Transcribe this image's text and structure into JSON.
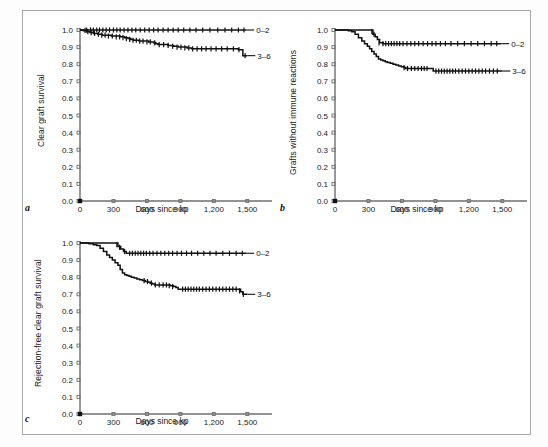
{
  "figure": {
    "background": "#ffffff",
    "frame_color": "#a9a9a9",
    "axis_color": "#6e6e6e",
    "curve_color": "#111111"
  },
  "axes_common": {
    "xlabel": "Days since kp",
    "xticks": [
      "0",
      "300",
      "600",
      "900",
      "1,200",
      "1,500"
    ],
    "xtick_values": [
      0,
      300,
      600,
      900,
      1200,
      1500
    ],
    "yticks": [
      "0.0",
      "0.1",
      "0.2",
      "0.3",
      "0.4",
      "0.5",
      "0.6",
      "0.7",
      "0.8",
      "0.9",
      "1.0"
    ],
    "ytick_values": [
      0.0,
      0.1,
      0.2,
      0.3,
      0.4,
      0.5,
      0.6,
      0.7,
      0.8,
      0.9,
      1.0
    ],
    "xlim": [
      0,
      1560
    ],
    "ylim": [
      0.0,
      1.0
    ],
    "series_labels": [
      "0–2",
      "3–6"
    ]
  },
  "panels": [
    {
      "letter": "a",
      "ylabel": "Clear graft survival"
    },
    {
      "letter": "b",
      "ylabel": "Grafts without immune reactions"
    },
    {
      "letter": "c",
      "ylabel": "Rejection-free clear graft survival"
    }
  ],
  "chart_data": [
    {
      "type": "line",
      "panel": "a",
      "title": "",
      "xlabel": "Days since kp",
      "ylabel": "Clear graft survival",
      "xlim": [
        0,
        1560
      ],
      "ylim": [
        0.0,
        1.0
      ],
      "grid": false,
      "legend_position": "right-of-curve-end",
      "series": [
        {
          "name": "0–2",
          "label": "0–2",
          "step": "post",
          "x": [
            0,
            40,
            90,
            140,
            200,
            260,
            330,
            400,
            470,
            540,
            620,
            700,
            780,
            860,
            950,
            1040,
            1130,
            1220,
            1320,
            1420,
            1490
          ],
          "y": [
            1.0,
            1.0,
            1.0,
            1.0,
            1.0,
            1.0,
            1.0,
            1.0,
            1.0,
            1.0,
            1.0,
            1.0,
            1.0,
            1.0,
            1.0,
            1.0,
            1.0,
            1.0,
            1.0,
            1.0,
            1.0
          ],
          "censor_x": [
            60,
            95,
            120,
            150,
            175,
            205,
            235,
            265,
            300,
            330,
            360,
            395,
            430,
            465,
            500,
            540,
            580,
            620,
            660,
            700,
            745,
            790,
            835,
            880,
            930,
            985,
            1040,
            1100,
            1165,
            1235,
            1300,
            1360,
            1420,
            1470
          ],
          "censor_y": [
            1.0,
            1.0,
            1.0,
            1.0,
            1.0,
            1.0,
            1.0,
            1.0,
            1.0,
            1.0,
            1.0,
            1.0,
            1.0,
            1.0,
            1.0,
            1.0,
            1.0,
            1.0,
            1.0,
            1.0,
            1.0,
            1.0,
            1.0,
            1.0,
            1.0,
            1.0,
            1.0,
            1.0,
            1.0,
            1.0,
            1.0,
            1.0,
            1.0,
            1.0
          ]
        },
        {
          "name": "3–6",
          "label": "3–6",
          "step": "post",
          "x": [
            0,
            30,
            60,
            90,
            120,
            160,
            200,
            240,
            280,
            320,
            360,
            400,
            430,
            455,
            480,
            505,
            530,
            560,
            590,
            615,
            640,
            660,
            680,
            700,
            740,
            790,
            840,
            880,
            920,
            960,
            1000,
            1050,
            1100,
            1180,
            1260,
            1340,
            1420,
            1460,
            1470,
            1500
          ],
          "y": [
            1.0,
            0.995,
            0.99,
            0.985,
            0.98,
            0.975,
            0.97,
            0.97,
            0.965,
            0.965,
            0.96,
            0.955,
            0.95,
            0.945,
            0.94,
            0.94,
            0.935,
            0.935,
            0.935,
            0.93,
            0.93,
            0.925,
            0.92,
            0.915,
            0.915,
            0.91,
            0.905,
            0.9,
            0.9,
            0.895,
            0.89,
            0.89,
            0.89,
            0.89,
            0.89,
            0.89,
            0.885,
            0.85,
            0.85,
            0.85
          ],
          "censor_x": [
            45,
            70,
            100,
            130,
            165,
            195,
            225,
            255,
            290,
            325,
            355,
            385,
            415,
            445,
            475,
            505,
            535,
            565,
            600,
            630,
            670,
            710,
            750,
            790,
            830,
            870,
            905,
            940,
            975,
            1010,
            1050,
            1090,
            1130,
            1175,
            1220,
            1270,
            1320,
            1375,
            1425,
            1480
          ],
          "censor_y": [
            0.998,
            0.99,
            0.985,
            0.98,
            0.975,
            0.97,
            0.97,
            0.965,
            0.965,
            0.96,
            0.96,
            0.955,
            0.95,
            0.945,
            0.94,
            0.94,
            0.935,
            0.935,
            0.93,
            0.93,
            0.925,
            0.915,
            0.915,
            0.91,
            0.905,
            0.9,
            0.9,
            0.895,
            0.895,
            0.89,
            0.89,
            0.89,
            0.89,
            0.89,
            0.89,
            0.89,
            0.89,
            0.89,
            0.885,
            0.85
          ]
        }
      ]
    },
    {
      "type": "line",
      "panel": "b",
      "title": "",
      "xlabel": "Days since kp",
      "ylabel": "Grafts without immune reactions",
      "xlim": [
        0,
        1560
      ],
      "ylim": [
        0.0,
        1.0
      ],
      "grid": false,
      "legend_position": "right-of-curve-end",
      "series": [
        {
          "name": "0–2",
          "label": "0–2",
          "step": "post",
          "x": [
            0,
            60,
            120,
            180,
            240,
            300,
            340,
            360,
            380,
            400,
            430,
            470,
            520,
            600,
            700,
            800,
            900,
            1000,
            1100,
            1200,
            1300,
            1400,
            1490
          ],
          "y": [
            1.0,
            1.0,
            1.0,
            1.0,
            1.0,
            1.0,
            0.975,
            0.96,
            0.945,
            0.925,
            0.92,
            0.92,
            0.92,
            0.92,
            0.92,
            0.92,
            0.92,
            0.92,
            0.92,
            0.92,
            0.92,
            0.92,
            0.92
          ],
          "censor_x": [
            330,
            350,
            395,
            430,
            455,
            480,
            505,
            530,
            555,
            580,
            610,
            645,
            680,
            715,
            750,
            790,
            830,
            870,
            905,
            945,
            990,
            1040,
            1100,
            1160,
            1220,
            1280,
            1340,
            1400,
            1450
          ],
          "censor_y": [
            0.99,
            0.975,
            0.925,
            0.92,
            0.92,
            0.92,
            0.92,
            0.92,
            0.92,
            0.92,
            0.92,
            0.92,
            0.92,
            0.92,
            0.92,
            0.92,
            0.92,
            0.92,
            0.92,
            0.92,
            0.92,
            0.92,
            0.92,
            0.92,
            0.92,
            0.92,
            0.92,
            0.92,
            0.92
          ]
        },
        {
          "name": "3–6",
          "label": "3–6",
          "step": "post",
          "x": [
            0,
            40,
            80,
            120,
            150,
            180,
            210,
            240,
            265,
            290,
            310,
            330,
            350,
            370,
            390,
            410,
            430,
            450,
            470,
            495,
            520,
            545,
            570,
            595,
            615,
            635,
            660,
            700,
            740,
            780,
            820,
            850,
            870,
            880,
            900,
            950,
            1000,
            1060,
            1120,
            1180,
            1250,
            1320,
            1400,
            1470,
            1500
          ],
          "y": [
            1.0,
            1.0,
            1.0,
            0.995,
            0.99,
            0.975,
            0.955,
            0.935,
            0.92,
            0.905,
            0.89,
            0.875,
            0.86,
            0.845,
            0.83,
            0.825,
            0.82,
            0.815,
            0.81,
            0.805,
            0.8,
            0.795,
            0.79,
            0.785,
            0.78,
            0.775,
            0.775,
            0.775,
            0.775,
            0.775,
            0.775,
            0.775,
            0.775,
            0.76,
            0.76,
            0.76,
            0.76,
            0.76,
            0.76,
            0.76,
            0.76,
            0.76,
            0.76,
            0.76,
            0.76
          ],
          "censor_x": [
            620,
            650,
            685,
            715,
            745,
            775,
            800,
            825,
            905,
            930,
            955,
            980,
            1005,
            1030,
            1055,
            1080,
            1110,
            1140,
            1170,
            1200,
            1230,
            1260,
            1290,
            1320,
            1350,
            1385,
            1420,
            1455
          ],
          "censor_y": [
            0.78,
            0.775,
            0.775,
            0.775,
            0.775,
            0.775,
            0.775,
            0.775,
            0.76,
            0.76,
            0.76,
            0.76,
            0.76,
            0.76,
            0.76,
            0.76,
            0.76,
            0.76,
            0.76,
            0.76,
            0.76,
            0.76,
            0.76,
            0.76,
            0.76,
            0.76,
            0.76,
            0.76
          ]
        }
      ]
    },
    {
      "type": "line",
      "panel": "c",
      "title": "",
      "xlabel": "Days since kp",
      "ylabel": "Rejection-free clear graft survival",
      "xlim": [
        0,
        1560
      ],
      "ylim": [
        0.0,
        1.0
      ],
      "grid": false,
      "legend_position": "right-of-curve-end",
      "series": [
        {
          "name": "0–2",
          "label": "0–2",
          "step": "post",
          "x": [
            0,
            60,
            120,
            180,
            240,
            300,
            340,
            365,
            390,
            415,
            440,
            480,
            540,
            620,
            700,
            800,
            900,
            1000,
            1100,
            1200,
            1300,
            1400,
            1490
          ],
          "y": [
            1.0,
            1.0,
            1.0,
            1.0,
            1.0,
            1.0,
            0.98,
            0.965,
            0.95,
            0.94,
            0.94,
            0.94,
            0.94,
            0.94,
            0.94,
            0.94,
            0.94,
            0.94,
            0.94,
            0.94,
            0.94,
            0.94,
            0.94
          ],
          "censor_x": [
            330,
            355,
            400,
            445,
            470,
            495,
            520,
            545,
            570,
            595,
            625,
            655,
            690,
            725,
            760,
            795,
            830,
            870,
            910,
            955,
            1000,
            1055,
            1110,
            1165,
            1220,
            1280,
            1340,
            1400,
            1455
          ],
          "censor_y": [
            0.99,
            0.975,
            0.95,
            0.94,
            0.94,
            0.94,
            0.94,
            0.94,
            0.94,
            0.94,
            0.94,
            0.94,
            0.94,
            0.94,
            0.94,
            0.94,
            0.94,
            0.94,
            0.94,
            0.94,
            0.94,
            0.94,
            0.94,
            0.94,
            0.94,
            0.94,
            0.94,
            0.94,
            0.94
          ]
        },
        {
          "name": "3–6",
          "label": "3–6",
          "step": "post",
          "x": [
            0,
            40,
            80,
            120,
            150,
            180,
            210,
            240,
            265,
            290,
            315,
            340,
            360,
            380,
            400,
            420,
            440,
            460,
            485,
            510,
            535,
            560,
            585,
            610,
            630,
            650,
            670,
            700,
            740,
            780,
            810,
            840,
            860,
            880,
            900,
            960,
            1020,
            1080,
            1140,
            1200,
            1270,
            1340,
            1400,
            1440,
            1460,
            1490,
            1500
          ],
          "y": [
            1.0,
            1.0,
            0.995,
            0.99,
            0.985,
            0.97,
            0.95,
            0.93,
            0.915,
            0.9,
            0.885,
            0.87,
            0.845,
            0.825,
            0.815,
            0.81,
            0.805,
            0.8,
            0.795,
            0.79,
            0.785,
            0.78,
            0.775,
            0.77,
            0.765,
            0.76,
            0.755,
            0.755,
            0.755,
            0.755,
            0.75,
            0.745,
            0.74,
            0.73,
            0.73,
            0.73,
            0.73,
            0.73,
            0.73,
            0.73,
            0.73,
            0.73,
            0.73,
            0.715,
            0.7,
            0.7,
            0.7
          ],
          "censor_x": [
            575,
            605,
            640,
            675,
            710,
            745,
            775,
            800,
            830,
            920,
            945,
            970,
            995,
            1020,
            1045,
            1070,
            1100,
            1130,
            1160,
            1190,
            1220,
            1250,
            1280,
            1310,
            1340,
            1370,
            1400,
            1430,
            1465
          ],
          "censor_y": [
            0.78,
            0.775,
            0.765,
            0.755,
            0.755,
            0.755,
            0.755,
            0.75,
            0.745,
            0.73,
            0.73,
            0.73,
            0.73,
            0.73,
            0.73,
            0.73,
            0.73,
            0.73,
            0.73,
            0.73,
            0.73,
            0.73,
            0.73,
            0.73,
            0.73,
            0.73,
            0.73,
            0.72,
            0.7
          ]
        }
      ]
    }
  ]
}
